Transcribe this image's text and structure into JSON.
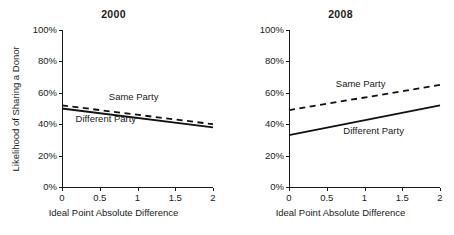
{
  "figure": {
    "background": "#ffffff",
    "ink_color": "#111111"
  },
  "chart_data": [
    {
      "type": "line",
      "title": "2000",
      "xlabel": "Ideal Point Absolute Difference",
      "ylabel": "Likelihood of Sharing a Donor",
      "xlim": [
        0,
        2
      ],
      "ylim": [
        0,
        1
      ],
      "grid": false,
      "legend_position": "inline-annotation",
      "xticks": [
        0,
        0.5,
        1,
        1.5,
        2
      ],
      "xticklabels": [
        "0",
        "0.5",
        "1",
        "1.5",
        "2"
      ],
      "yticks": [
        0,
        0.2,
        0.4,
        0.6,
        0.8,
        1.0
      ],
      "yticklabels": [
        "0%",
        "20%",
        "40%",
        "60%",
        "80%",
        "100%"
      ],
      "series": [
        {
          "name": "Same Party",
          "style": "dashed",
          "x": [
            0,
            2
          ],
          "values": [
            0.52,
            0.4
          ]
        },
        {
          "name": "Different Party",
          "style": "solid",
          "x": [
            0,
            2
          ],
          "values": [
            0.5,
            0.38
          ]
        }
      ],
      "annotations": [
        {
          "text": "Same Party",
          "x": 0.62,
          "y": 0.575
        },
        {
          "text": "Different Party",
          "x": 0.18,
          "y": 0.435
        }
      ]
    },
    {
      "type": "line",
      "title": "2008",
      "xlabel": "Ideal Point Absolute Difference",
      "ylabel": "Likelihood of Sharing a Donor",
      "xlim": [
        0,
        2
      ],
      "ylim": [
        0,
        1
      ],
      "grid": false,
      "legend_position": "inline-annotation",
      "xticks": [
        0,
        0.5,
        1,
        1.5,
        2
      ],
      "xticklabels": [
        "0",
        "0.5",
        "1",
        "1.5",
        "2"
      ],
      "yticks": [
        0,
        0.2,
        0.4,
        0.6,
        0.8,
        1.0
      ],
      "yticklabels": [
        "0%",
        "20%",
        "40%",
        "60%",
        "80%",
        "100%"
      ],
      "series": [
        {
          "name": "Same Party",
          "style": "dashed",
          "x": [
            0,
            2
          ],
          "values": [
            0.49,
            0.65
          ]
        },
        {
          "name": "Different Party",
          "style": "solid",
          "x": [
            0,
            2
          ],
          "values": [
            0.33,
            0.52
          ]
        }
      ],
      "annotations": [
        {
          "text": "Same Party",
          "x": 0.62,
          "y": 0.655
        },
        {
          "text": "Different Party",
          "x": 0.72,
          "y": 0.355
        }
      ]
    }
  ]
}
